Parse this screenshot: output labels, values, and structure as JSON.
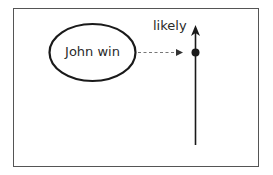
{
  "diagram": {
    "node": {
      "label": "John win",
      "shape": "ellipse"
    },
    "axis": {
      "label": "likely",
      "direction": "up"
    },
    "connector": {
      "style": "dashed",
      "from": "John win",
      "to": "likely-axis-point"
    },
    "colors": {
      "stroke": "#1a1a1a",
      "frame": "#555555",
      "dashed": "#777777",
      "background": "#ffffff"
    }
  }
}
